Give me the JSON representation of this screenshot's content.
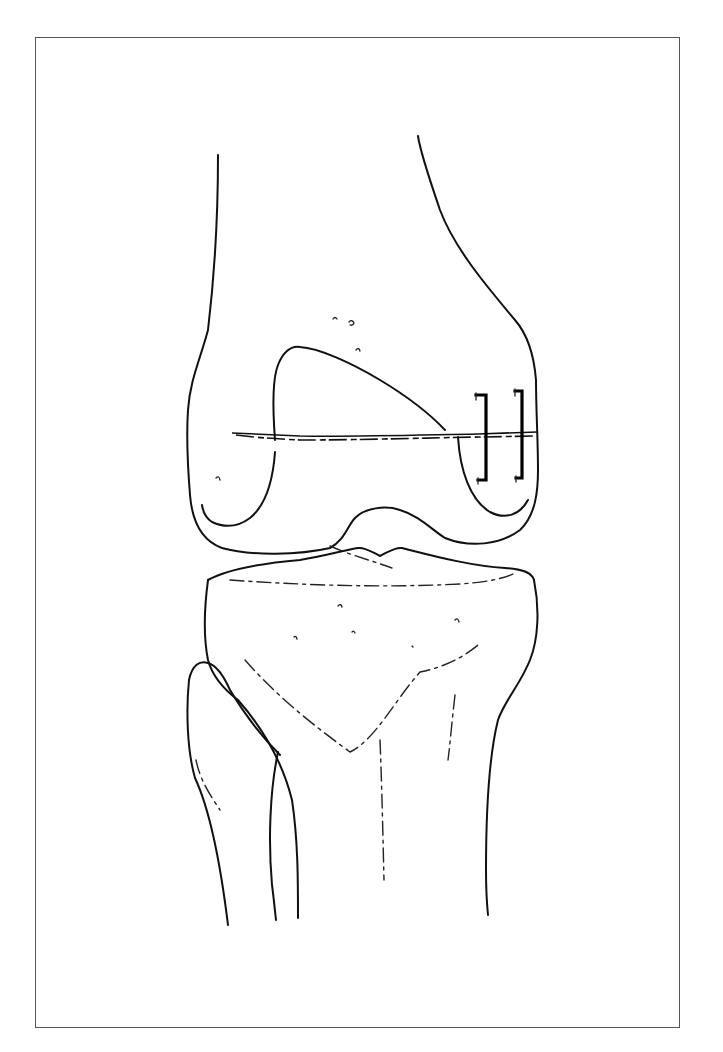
{
  "figure": {
    "type": "anatomical line illustration",
    "frame_color": "#555555",
    "line_color": "#111111",
    "background": "#ffffff",
    "structures": [
      {
        "name": "femur",
        "region": "upper"
      },
      {
        "name": "femoral-condyle-fracture-line",
        "orientation": "horizontal"
      },
      {
        "name": "staple",
        "count": 2
      },
      {
        "name": "tibia",
        "region": "lower-center"
      },
      {
        "name": "fibula",
        "region": "lower-left"
      }
    ]
  }
}
